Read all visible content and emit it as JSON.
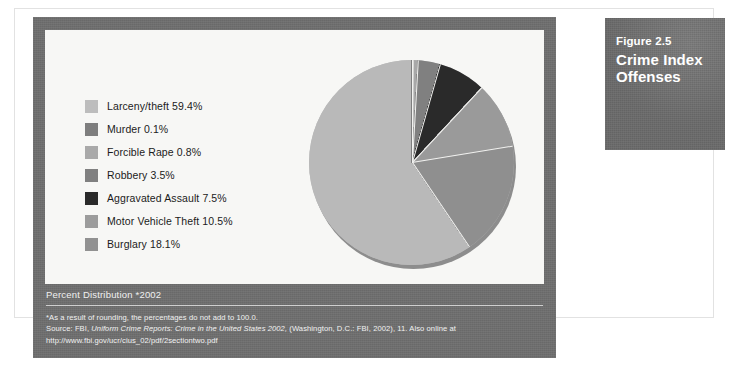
{
  "figure": {
    "number_label": "Figure 2.5",
    "title_line1": "Crime Index",
    "title_line2": "Offenses"
  },
  "caption": {
    "title": "Percent Distribution *2002",
    "note": "*As a result of rounding, the percentages do not add to 100.0.",
    "source_prefix": "Source: FBI, ",
    "source_italic": "Uniform Crime Reports: Crime in the United States 2002,",
    "source_suffix": " (Washington, D.C.: FBI, 2002), 11. Also online at",
    "url": "http://www.fbi.gov/ucr/cius_02/pdf/2sectiontwo.pdf"
  },
  "colors": {
    "panel_gray": "#6e6e6e",
    "plot_bg": "#f7f7f5",
    "fig_box_gray": "#6f6f6f",
    "text_light": "#f2f2f2",
    "text_dark": "#1b1b1b"
  },
  "chart_data": {
    "type": "pie",
    "title": "Percent Distribution *2002",
    "unit": "percent",
    "start_angle_deg": 0,
    "direction": "clockwise",
    "legend_position": "left",
    "total": 99.9,
    "categories": [
      "Larceny/theft",
      "Murder",
      "Forcible Rape",
      "Robbery",
      "Aggravated Assault",
      "Motor Vehicle Theft",
      "Burglary"
    ],
    "values": [
      59.4,
      0.1,
      0.8,
      3.5,
      7.5,
      10.5,
      18.1
    ],
    "slice_colors": [
      "#b9b9b9",
      "#7e7e7e",
      "#a8a8a8",
      "#808080",
      "#2a2a2a",
      "#9a9a9a",
      "#8f8f8f"
    ],
    "legend": [
      {
        "label": "Larceny/theft 59.4%",
        "name": "Larceny/theft",
        "value": 59.4,
        "color": "#bdbdbd"
      },
      {
        "label": "Murder 0.1%",
        "name": "Murder",
        "value": 0.1,
        "color": "#7e7e7e"
      },
      {
        "label": "Forcible Rape 0.8%",
        "name": "Forcible Rape",
        "value": 0.8,
        "color": "#a9a9a9"
      },
      {
        "label": "Robbery 3.5%",
        "name": "Robbery",
        "value": 3.5,
        "color": "#808080"
      },
      {
        "label": "Aggravated Assault 7.5%",
        "name": "Aggravated Assault",
        "value": 7.5,
        "color": "#2a2a2a"
      },
      {
        "label": "Motor Vehicle Theft 10.5%",
        "name": "Motor Vehicle Theft",
        "value": 10.5,
        "color": "#9c9c9c"
      },
      {
        "label": "Burglary 18.1%",
        "name": "Burglary",
        "value": 18.1,
        "color": "#919191"
      }
    ]
  }
}
